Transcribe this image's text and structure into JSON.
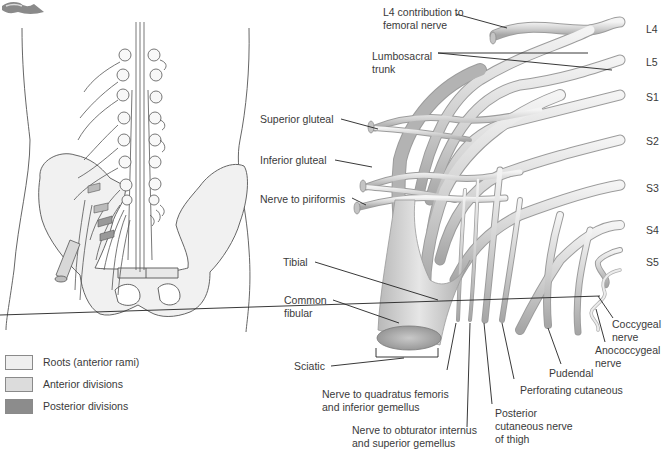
{
  "figure": {
    "type": "anatomical-diagram"
  },
  "legend": {
    "items": [
      {
        "label": "Roots (anterior rami)",
        "color": "#eeeeee"
      },
      {
        "label": "Anterior divisions",
        "color": "#dcdcdc"
      },
      {
        "label": "Posterior divisions",
        "color": "#8c8c8c"
      }
    ]
  },
  "root_labels": {
    "l4": "L4",
    "l5": "L5",
    "s1": "S1",
    "s2": "S2",
    "s3": "S3",
    "s4": "S4",
    "s5": "S5"
  },
  "nerve_labels": {
    "l4_femoral_line1": "L4 contribution to",
    "l4_femoral_line2": "femoral nerve",
    "lumbosacral_line1": "Lumbosacral",
    "lumbosacral_line2": "trunk",
    "superior_gluteal": "Superior gluteal",
    "inferior_gluteal": "Inferior gluteal",
    "nerve_to_piriformis": "Nerve to piriformis",
    "tibial": "Tibial",
    "common_fibular_line1": "Common",
    "common_fibular_line2": "fibular",
    "sciatic": "Sciatic",
    "quadratus_line1": "Nerve to quadratus femoris",
    "quadratus_line2": "and inferior gemellus",
    "obturator_line1": "Nerve to obturator internus",
    "obturator_line2": "and superior gemellus",
    "posterior_cut_line1": "Posterior",
    "posterior_cut_line2": "cutaneous nerve",
    "posterior_cut_line3": "of thigh",
    "perforating_cutaneous": "Perforating cutaneous",
    "pudendal": "Pudendal",
    "coccygeal_line1": "Coccygeal",
    "coccygeal_line2": "nerve",
    "anococcygeal_line1": "Anococcygeal",
    "anococcygeal_line2": "nerve"
  },
  "colors": {
    "nerve_fill": "#d6d6d6",
    "nerve_stroke": "#a8a8a8",
    "nerve_dark": "#9a9a9a",
    "leader": "#222222",
    "outline": "#6a6a6a"
  }
}
